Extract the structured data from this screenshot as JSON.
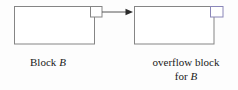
{
  "figure": {
    "background_color": "#fdfdfd",
    "line_color": "#858585",
    "accent_line_color": "#8a86b8",
    "text_color": "#1a1a1a",
    "labels": {
      "block_b": {
        "text": "Block",
        "italic_var": "B"
      },
      "overflow_block": {
        "line1": "overflow block",
        "line2_prefix": "for",
        "line2_italic_var": "B"
      }
    },
    "shapes": {
      "left_block": {
        "x": 14,
        "y": 6,
        "width": 80,
        "height": 38
      },
      "left_pointer_cell": {
        "x": 90,
        "y": 6,
        "width": 12,
        "height": 11
      },
      "right_block": {
        "x": 134,
        "y": 6,
        "width": 80,
        "height": 38
      },
      "right_pointer_cell": {
        "x": 210,
        "y": 6,
        "width": 13,
        "height": 11
      },
      "arrow": {
        "x1": 102,
        "y1": 12,
        "x2": 133,
        "y2": 12
      }
    }
  }
}
